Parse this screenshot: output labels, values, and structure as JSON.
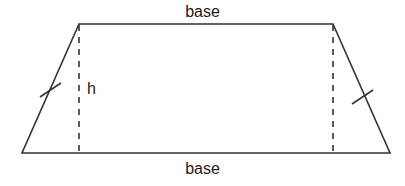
{
  "figure": {
    "kind": "geometry-diagram",
    "shape": "isosceles-trapezoid",
    "width": 405,
    "height": 186,
    "background_color": "#ffffff",
    "stroke_color": "#333333",
    "text_color": "#1a1a1a",
    "labels": {
      "base_top": "base",
      "base_bottom": "base",
      "height": "h"
    },
    "geometry": {
      "vertices": {
        "top_left": [
          79,
          24
        ],
        "top_right": [
          333,
          24
        ],
        "bottom_right": [
          390,
          153
        ],
        "bottom_left": [
          22,
          153
        ]
      },
      "height_lines": [
        {
          "x": 79,
          "y1": 24,
          "y2": 153
        },
        {
          "x": 333,
          "y1": 24,
          "y2": 153
        }
      ],
      "tick_marks": [
        {
          "side": "left-leg",
          "center": [
            50,
            90
          ]
        },
        {
          "side": "right-leg",
          "center": [
            362,
            97
          ]
        }
      ],
      "top_base_length_px": 254,
      "bottom_base_length_px": 368,
      "height_px": 129
    }
  }
}
